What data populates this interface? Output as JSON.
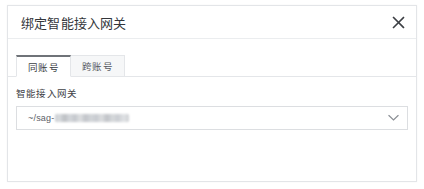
{
  "dialog": {
    "title": "绑定智能接入网关",
    "close_icon": "close-icon",
    "close_label": "✕"
  },
  "tabs": [
    {
      "label": "同账号",
      "active": true
    },
    {
      "label": "跨账号",
      "active": false
    }
  ],
  "form": {
    "field_label": "智能接入网关",
    "select": {
      "value_prefix": "~/sag-",
      "value_redacted": true,
      "placeholder": "请选择智能接入网关",
      "arrow_icon": "chevron-down-icon"
    }
  },
  "colors": {
    "panel_background": "#ffffff",
    "panel_border": "#e3e5e8",
    "divider": "#ebedef",
    "title_text": "#33363b",
    "tab_active_indicator": "#6f7378",
    "tab_inactive_background": "#f6f7f8",
    "tab_border": "#e4e6e9",
    "input_border": "#dcdee1",
    "input_text": "#5c6067",
    "redaction_block": "#c9ccd0"
  }
}
